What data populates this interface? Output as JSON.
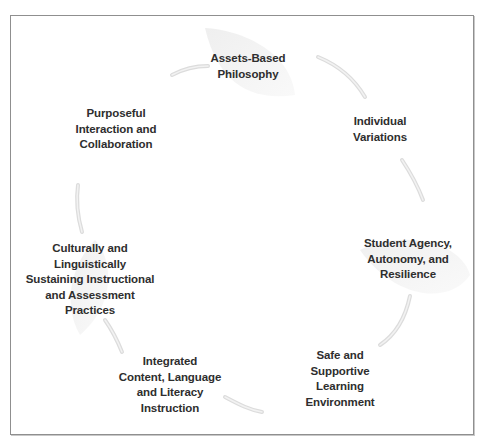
{
  "diagram": {
    "type": "cycle",
    "border_color": "#8f8f8f",
    "text_color": "#2e2e2e",
    "nodes": [
      {
        "id": "assets",
        "lines": [
          "Assets-Based",
          "Philosophy"
        ]
      },
      {
        "id": "individual",
        "lines": [
          "Individual",
          "Variations"
        ]
      },
      {
        "id": "agency",
        "lines": [
          "Student Agency,",
          "Autonomy, and",
          "Resilience"
        ]
      },
      {
        "id": "safe",
        "lines": [
          "Safe and",
          "Supportive",
          "Learning",
          "Environment"
        ]
      },
      {
        "id": "integrated",
        "lines": [
          "Integrated",
          "Content, Language",
          "and Literacy",
          "Instruction"
        ]
      },
      {
        "id": "culturally",
        "lines": [
          "Culturally and",
          "Linguistically",
          "Sustaining Instructional",
          "and Assessment",
          "Practices"
        ]
      },
      {
        "id": "purposeful",
        "lines": [
          "Purposeful",
          "Interaction and",
          "Collaboration"
        ]
      }
    ]
  }
}
